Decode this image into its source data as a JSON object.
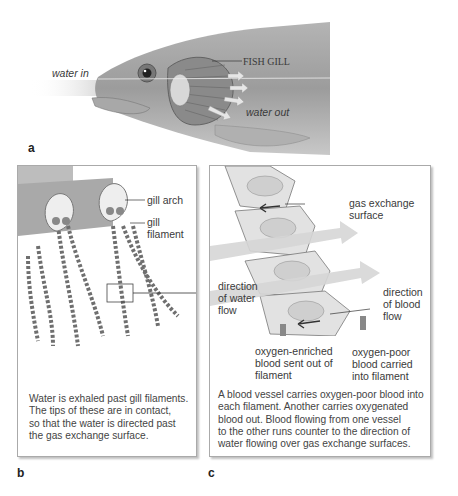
{
  "panels": {
    "a": {
      "letter": "a",
      "labels": {
        "water_in": "water in",
        "fish_gill": "FISH GILL",
        "water_out": "water out"
      }
    },
    "b": {
      "letter": "b",
      "labels": {
        "gill_arch": "gill arch",
        "gill_filament_1": "gill",
        "gill_filament_2": "filament"
      },
      "caption": [
        "Water is exhaled past gill filaments.",
        "The tips of these are in contact,",
        "so that the water is directed past",
        "the gas exchange surface."
      ]
    },
    "c": {
      "letter": "c",
      "labels": {
        "gas_exchange_1": "gas exchange",
        "gas_exchange_2": "surface",
        "water_flow_1": "direction",
        "water_flow_2": "of water",
        "water_flow_3": "flow",
        "blood_flow_1": "direction",
        "blood_flow_2": "of blood",
        "blood_flow_3": "flow",
        "enriched_1": "oxygen-enriched",
        "enriched_2": "blood sent out of",
        "enriched_3": "filament",
        "poor_1": "oxygen-poor",
        "poor_2": "blood carried",
        "poor_3": "into filament"
      },
      "caption": [
        "A blood vessel carries oxygen-poor blood into",
        "each filament. Another carries oxygenated",
        "blood out. Blood flowing from one vessel",
        "to the other runs counter to the direction of",
        "water flowing over gas exchange surfaces."
      ]
    }
  },
  "colors": {
    "fish_body": "#9a9a9a",
    "gill_stripe": "#6f6f6f",
    "water_arrow": "#d9d9d9",
    "box_border": "#aaaaaa"
  }
}
